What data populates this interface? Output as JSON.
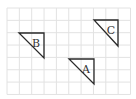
{
  "diagram": {
    "grid": {
      "x0": 7,
      "y0": 8,
      "cell": 12.35,
      "cols": 10,
      "rows": 7,
      "line_color": "#e2e2e2"
    },
    "stroke_color": "#2a2a2a",
    "triangles": [
      {
        "label": "A",
        "points": [
          [
            69,
            59
          ],
          [
            94,
            59
          ],
          [
            94,
            84
          ]
        ],
        "label_pos": [
          86,
          69
        ]
      },
      {
        "label": "B",
        "points": [
          [
            19,
            33
          ],
          [
            44,
            33
          ],
          [
            44,
            58
          ]
        ],
        "label_pos": [
          36,
          43
        ]
      },
      {
        "label": "C",
        "points": [
          [
            94,
            20
          ],
          [
            118,
            20
          ],
          [
            118,
            46
          ]
        ],
        "label_pos": [
          111,
          30
        ]
      }
    ]
  }
}
